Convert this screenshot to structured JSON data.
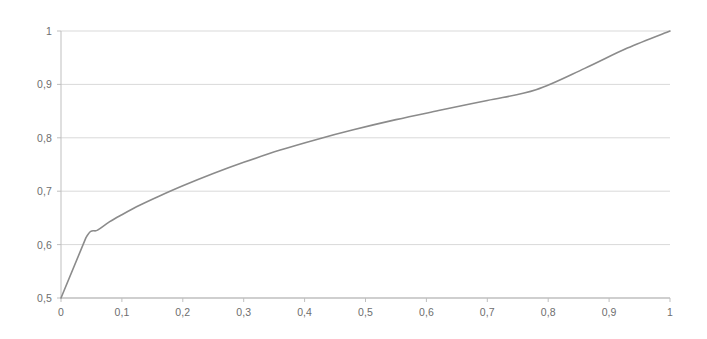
{
  "chart_data": {
    "type": "line",
    "title": "",
    "subtitle": "",
    "xlabel": "",
    "ylabel": "",
    "xlim": [
      0,
      1
    ],
    "ylim": [
      0.5,
      1
    ],
    "grid": true,
    "grid_axis": "y",
    "legend": false,
    "legend_position": "none",
    "line_color": "#8b8b8b",
    "grid_color": "#d9d9d9",
    "axis_color": "#bfbfbf",
    "tick_label_color": "#6e6e6e",
    "background_color": "#ffffff",
    "decimal_separator": ",",
    "x_ticks": [
      0,
      0.1,
      0.2,
      0.3,
      0.4,
      0.5,
      0.6,
      0.7,
      0.8,
      0.9,
      1
    ],
    "x_tick_labels": [
      "0",
      "0,1",
      "0,2",
      "0,3",
      "0,4",
      "0,5",
      "0,6",
      "0,7",
      "0,8",
      "0,9",
      "1"
    ],
    "y_ticks": [
      0.5,
      0.6,
      0.7,
      0.8,
      0.9,
      1
    ],
    "y_tick_labels": [
      "0,5",
      "0,6",
      "0,7",
      "0,8",
      "0,9",
      "1"
    ],
    "series": [
      {
        "name": "curve",
        "color": "#8b8b8b",
        "x": [
          0,
          0.041,
          0.06,
          0.08,
          0.1,
          0.13,
          0.16,
          0.2,
          0.25,
          0.3,
          0.36,
          0.42,
          0.48,
          0.55,
          0.62,
          0.7,
          0.78,
          0.86,
          0.93,
          1
        ],
        "y": [
          0.5,
          0.613,
          0.627,
          0.643,
          0.656,
          0.674,
          0.69,
          0.71,
          0.733,
          0.754,
          0.777,
          0.797,
          0.815,
          0.834,
          0.851,
          0.87,
          0.89,
          0.93,
          0.968,
          1
        ]
      }
    ]
  },
  "axes": {
    "plot_left_px": 61,
    "plot_right_px": 670,
    "plot_top_px": 31,
    "plot_bottom_px": 298
  }
}
